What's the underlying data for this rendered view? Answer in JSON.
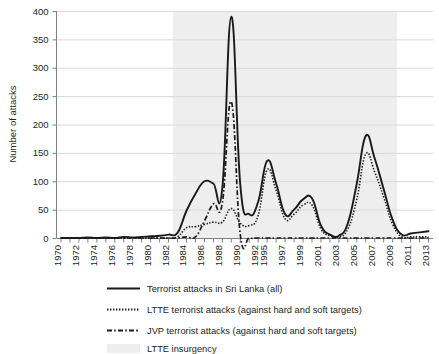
{
  "chart_data": {
    "type": "line",
    "title": "",
    "xlabel": "",
    "ylabel": "Number of attacks",
    "ylim": [
      0,
      400
    ],
    "ytick_step": 50,
    "yticks": [
      "0",
      "50",
      "100",
      "150",
      "200",
      "250",
      "300",
      "350",
      "400"
    ],
    "grid": "horizontal",
    "legend_position": "below-plot",
    "x": [
      1970,
      1971,
      1972,
      1973,
      1974,
      1975,
      1976,
      1977,
      1978,
      1979,
      1980,
      1981,
      1982,
      1983,
      1984,
      1985,
      1986,
      1987,
      1988,
      1989,
      1990,
      1991,
      1992,
      1995,
      1996,
      1997,
      1998,
      1999,
      2000,
      2001,
      2002,
      2003,
      2004,
      2005,
      2006,
      2007,
      2008,
      2009,
      2010,
      2011,
      2012,
      2013
    ],
    "xtick_labels": [
      "1970",
      "1972",
      "1974",
      "1976",
      "1978",
      "1980",
      "1982",
      "1984",
      "1986",
      "1988",
      "1990",
      "1992",
      "1995",
      "1997",
      "1999",
      "2001",
      "2003",
      "2005",
      "2007",
      "2009",
      "2011",
      "2013"
    ],
    "series": [
      {
        "name": "Terrorist attacks in Sri Lanka (all)",
        "style": "solid",
        "values": [
          0,
          0,
          0,
          1,
          0,
          1,
          0,
          2,
          1,
          2,
          3,
          4,
          6,
          9,
          48,
          78,
          100,
          96,
          88,
          390,
          94,
          42,
          64,
          136,
          96,
          42,
          50,
          68,
          70,
          22,
          6,
          4,
          26,
          96,
          180,
          140,
          86,
          32,
          6,
          8,
          10,
          12
        ]
      },
      {
        "name": "LTTE terrorist attacks (against hard and soft targets)",
        "style": "dotted",
        "values": [
          0,
          0,
          0,
          0,
          0,
          0,
          0,
          0,
          0,
          0,
          0,
          0,
          0,
          2,
          18,
          20,
          24,
          28,
          28,
          52,
          26,
          22,
          40,
          120,
          84,
          34,
          42,
          58,
          58,
          16,
          4,
          2,
          16,
          68,
          148,
          116,
          72,
          24,
          2,
          2,
          2,
          2
        ]
      },
      {
        "name": "JVP terrorist attacks (against hard and soft targets)",
        "style": "dash-dot",
        "values": [
          0,
          0,
          0,
          0,
          0,
          0,
          0,
          0,
          0,
          0,
          0,
          0,
          0,
          0,
          2,
          2,
          30,
          60,
          62,
          240,
          6,
          0,
          0,
          0,
          0,
          0,
          0,
          0,
          0,
          0,
          0,
          0,
          0,
          0,
          0,
          0,
          0,
          0,
          0,
          0,
          0,
          0
        ]
      }
    ],
    "shaded_region": {
      "name": "LTTE insurgency",
      "start_year": 1983,
      "end_year": 2009,
      "color": "#eeeeee"
    }
  },
  "legend": {
    "items": [
      {
        "label": "Terrorist attacks in Sri Lanka (all)",
        "marker": "solid-line"
      },
      {
        "label": "LTTE terrorist attacks (against hard and soft targets)",
        "marker": "dotted-line"
      },
      {
        "label": "JVP terrorist attacks (against hard and soft targets)",
        "marker": "dash-dot-line"
      },
      {
        "label": "LTTE insurgency",
        "marker": "shaded-band"
      }
    ]
  },
  "colors": {
    "line": "#1a1a1a",
    "band": "#eeeeee",
    "grid": "#d9d9d9",
    "axis": "#808080",
    "text": "#231f20"
  }
}
